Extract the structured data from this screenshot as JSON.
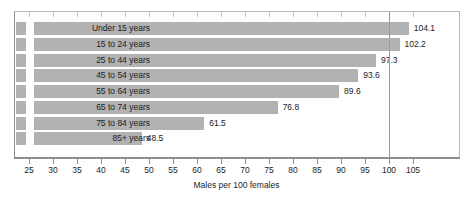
{
  "chart_data": {
    "type": "bar",
    "orientation": "horizontal",
    "title": "",
    "xlabel": "Males per 100 females",
    "ylabel": "",
    "categories": [
      "Under 15 years",
      "15 to 24 years",
      "25 to 44 years",
      "45 to 54 years",
      "55 to 64 years",
      "65 to 74 years",
      "75 to 84 years",
      "85+ years"
    ],
    "values": [
      104.1,
      102.2,
      97.3,
      93.6,
      89.6,
      76.8,
      61.5,
      48.5
    ],
    "value_labels": [
      "104.1",
      "102.2",
      "97.3",
      "93.6",
      "89.6",
      "76.8",
      "61.5",
      "48.5"
    ],
    "xlim": [
      22,
      108
    ],
    "xticks": [
      25,
      30,
      35,
      40,
      45,
      50,
      55,
      60,
      65,
      70,
      75,
      80,
      85,
      90,
      95,
      100,
      105
    ],
    "xtick_labels": [
      "25",
      "30",
      "35",
      "40",
      "45",
      "50",
      "55",
      "60",
      "65",
      "70",
      "75",
      "80",
      "85",
      "90",
      "95",
      "100",
      "105"
    ],
    "grid": false,
    "legend": null,
    "reference_line": 100,
    "bar_color": "#b2b2b2",
    "frame_color": "#8d8d8d",
    "text_color": "#1c1c1c"
  }
}
